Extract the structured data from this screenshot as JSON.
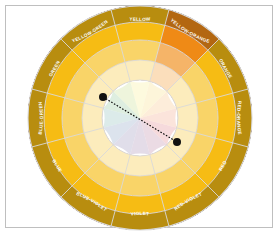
{
  "figure": {
    "type": "color-wheel",
    "frame_color": "#bfbfbf",
    "background_color": "#ffffff",
    "center_x": 140,
    "center_y": 118,
    "outer_radius": 112,
    "ring_radii": [
      38,
      58,
      78,
      96,
      112
    ],
    "ring_count": 4,
    "segment_count": 12,
    "divider_color": "#d9d9d9"
  },
  "segments": [
    {
      "label": "YELLOW",
      "angle_deg": 90,
      "hue_hex": "#f2e21c",
      "ring_hex": [
        "#fbf6c2",
        "#f7ee72",
        "#f2e21c",
        "#bdb016"
      ]
    },
    {
      "label": "YELLOW-GREEN",
      "angle_deg": 120,
      "hue_hex": "#9ac41f",
      "ring_hex": [
        "#e0edc0",
        "#c2dc72",
        "#9ac41f",
        "#769719"
      ]
    },
    {
      "label": "GREEN",
      "angle_deg": 150,
      "hue_hex": "#2e9b3e",
      "ring_hex": [
        "#c3e0c7",
        "#79c287",
        "#2e9b3e",
        "#227631"
      ]
    },
    {
      "label": "BLUE-GREEN",
      "angle_deg": 180,
      "hue_hex": "#17837f",
      "ring_hex": [
        "#bfdad9",
        "#68b3b1",
        "#17837f",
        "#106461"
      ]
    },
    {
      "label": "BLUE",
      "angle_deg": 210,
      "hue_hex": "#1f4f9c",
      "ring_hex": [
        "#c0ccdf",
        "#6f8fc4",
        "#1f4f9c",
        "#163a74"
      ]
    },
    {
      "label": "BLUE-VIOLET",
      "angle_deg": 240,
      "hue_hex": "#3b2f7e",
      "ring_hex": [
        "#c6c2d9",
        "#807abb",
        "#3b2f7e",
        "#2a215c"
      ]
    },
    {
      "label": "VIOLET",
      "angle_deg": 270,
      "hue_hex": "#5c2a74",
      "ring_hex": [
        "#cec0d5",
        "#9470a9",
        "#5c2a74",
        "#431d56"
      ]
    },
    {
      "label": "RED-VIOLET",
      "angle_deg": 300,
      "hue_hex": "#8e2060",
      "ring_hex": [
        "#dbbdcd",
        "#b76a96",
        "#8e2060",
        "#6a1747"
      ]
    },
    {
      "label": "RED",
      "angle_deg": 330,
      "hue_hex": "#c01a28",
      "ring_hex": [
        "#eebcc0",
        "#d96b74",
        "#c01a28",
        "#8e131e"
      ]
    },
    {
      "label": "RED-ORANGE",
      "angle_deg": 0,
      "hue_hex": "#e0541f",
      "ring_hex": [
        "#f7cdbd",
        "#ec8f6f",
        "#e0541f",
        "#a83e17"
      ]
    },
    {
      "label": "ORANGE",
      "angle_deg": 30,
      "hue_hex": "#ef8a16",
      "ring_hex": [
        "#fbdebb",
        "#f5b468",
        "#ef8a16",
        "#b36711"
      ]
    },
    {
      "label": "YELLOW-ORANGE",
      "angle_deg": 60,
      "hue_hex": "#f6bc14",
      "ring_hex": [
        "#fcecbc",
        "#f9d468",
        "#f6bc14",
        "#b88d0f"
      ]
    }
  ],
  "center_label": {
    "text": "",
    "visible": false
  },
  "complement_line": {
    "name": "complementary-pair-line",
    "style": "dotted",
    "color": "#111111",
    "point_a": {
      "x": 103,
      "y": 97,
      "label": ""
    },
    "point_b": {
      "x": 177,
      "y": 142,
      "label": ""
    },
    "marker_radius": 4
  },
  "legend": {
    "visible": false,
    "entries": []
  },
  "chart_data": {
    "type": "pie",
    "categories": [
      "YELLOW",
      "YELLOW-GREEN",
      "GREEN",
      "BLUE-GREEN",
      "BLUE",
      "BLUE-VIOLET",
      "VIOLET",
      "RED-VIOLET",
      "RED",
      "RED-ORANGE",
      "ORANGE",
      "YELLOW-ORANGE"
    ],
    "values": [
      30,
      30,
      30,
      30,
      30,
      30,
      30,
      30,
      30,
      30,
      30,
      30
    ],
    "rings": [
      "tint-light",
      "tint",
      "hue",
      "shade"
    ],
    "xlabel": "",
    "ylabel": "",
    "legend_position": "none",
    "grid": false
  }
}
